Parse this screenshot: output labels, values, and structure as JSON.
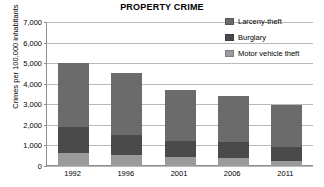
{
  "chart_data": {
    "type": "bar",
    "subtype": "stacked-bar",
    "title": "PROPERTY CRIME",
    "xlabel": "",
    "ylabel": "Crimes per 100,000 inhabitants",
    "categories": [
      "1992",
      "1996",
      "2001",
      "2006",
      "2011"
    ],
    "ylim": [
      0,
      7000
    ],
    "yticks": [
      "0",
      "1,000",
      "2,000",
      "3,000",
      "4,000",
      "5,000",
      "6,000",
      "7,000"
    ],
    "ytick_values": [
      0,
      1000,
      2000,
      3000,
      4000,
      5000,
      6000,
      7000
    ],
    "grid": true,
    "legend_position": "top-right",
    "series": [
      {
        "name": "Larceny-theft",
        "color": "#6b6b6b",
        "values": [
          3110,
          3000,
          2480,
          2250,
          2020
        ]
      },
      {
        "name": "Burglary",
        "color": "#4a4a4a",
        "values": [
          1250,
          970,
          790,
          750,
          710
        ]
      },
      {
        "name": "Motor vehicle theft",
        "color": "#9a9a9a",
        "values": [
          630,
          530,
          430,
          400,
          230
        ]
      }
    ],
    "stack_order_bottom_to_top": [
      "Motor vehicle theft",
      "Burglary",
      "Larceny-theft"
    ],
    "totals": [
      4990,
      4500,
      3700,
      3400,
      2960
    ]
  },
  "legend": {
    "items": [
      {
        "label": "Larceny-theft",
        "color": "#6b6b6b",
        "swatch_name": "legend-swatch-larceny-theft"
      },
      {
        "label": "Burglary",
        "color": "#4a4a4a",
        "swatch_name": "legend-swatch-burglary"
      },
      {
        "label": "Motor vehicle theft",
        "color": "#9a9a9a",
        "swatch_name": "legend-swatch-motor-vehicle-theft"
      }
    ]
  },
  "colors": {
    "gridline": "#b9b9b9",
    "axis": "#8e8e8e",
    "background": "#ffffff",
    "text": "#000000"
  }
}
